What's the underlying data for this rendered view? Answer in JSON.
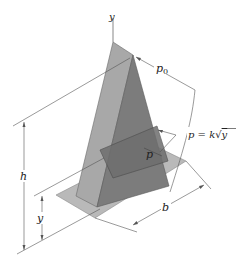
{
  "figure": {
    "labels": {
      "y_axis": "y",
      "p0": "p",
      "p0_sub": "0",
      "pressure_formula_lhs": "p = k",
      "pressure_formula_sqrt": "√",
      "pressure_formula_var": "y",
      "p_section": "p",
      "height": "h",
      "y_dim": "y",
      "base_width": "b"
    },
    "colors": {
      "left_face": "#a8a8a8",
      "right_face": "#7c7c7c",
      "plate": "#b9b9b9",
      "plate_edge": "#8a8a8a",
      "section": "#6e6e6e",
      "line": "#555555",
      "text": "#222222"
    }
  }
}
